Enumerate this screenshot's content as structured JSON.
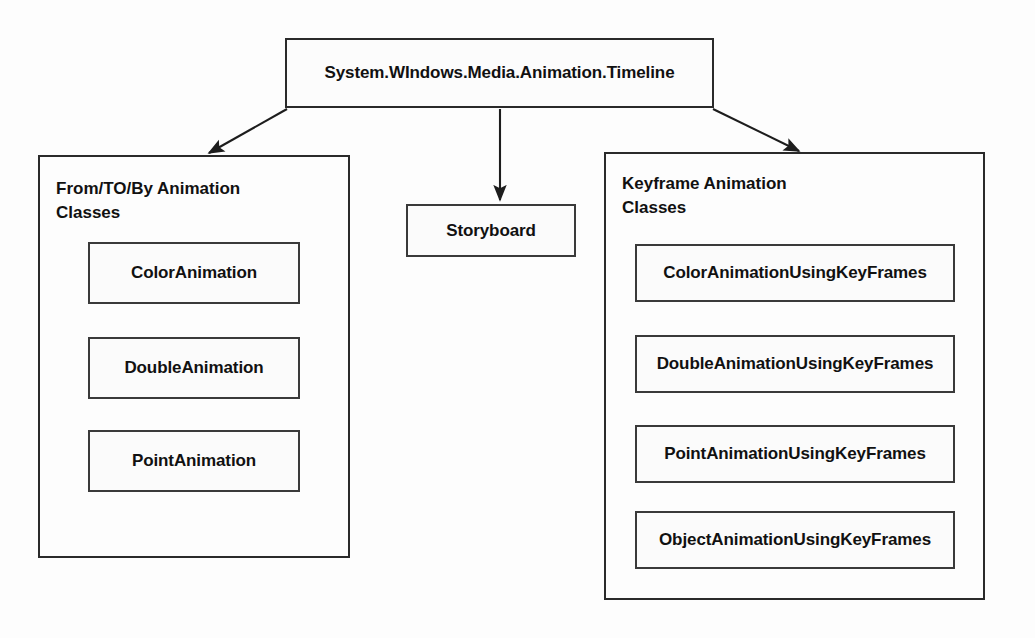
{
  "diagram": {
    "type": "class-hierarchy",
    "root": {
      "label": "System.WIndows.Media.Animation.Timeline"
    },
    "branches": [
      {
        "id": "from-to-by",
        "title": "From/TO/By Animation\nClasses",
        "items": [
          {
            "label": "ColorAnimation"
          },
          {
            "label": "DoubleAnimation"
          },
          {
            "label": "PointAnimation"
          }
        ]
      },
      {
        "id": "storyboard",
        "label": "Storyboard"
      },
      {
        "id": "keyframe",
        "title": "Keyframe Animation\nClasses",
        "items": [
          {
            "label": "ColorAnimationUsingKeyFrames"
          },
          {
            "label": "DoubleAnimationUsingKeyFrames"
          },
          {
            "label": "PointAnimationUsingKeyFrames"
          },
          {
            "label": "ObjectAnimationUsingKeyFrames"
          }
        ]
      }
    ],
    "colors": {
      "stroke": "#2a2a2a",
      "fill": "#fcfcfc",
      "background": "#fdfdfd",
      "text": "#111111"
    }
  }
}
